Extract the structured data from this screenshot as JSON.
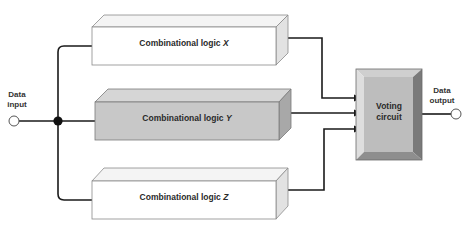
{
  "diagram": {
    "input": {
      "line1": "Data",
      "line2": "input"
    },
    "output": {
      "line1": "Data",
      "line2": "output"
    },
    "modules": [
      {
        "name_prefix": "Combinational logic ",
        "variable": "X",
        "shade": "light"
      },
      {
        "name_prefix": "Combinational logic ",
        "variable": "Y",
        "shade": "dark"
      },
      {
        "name_prefix": "Combinational logic ",
        "variable": "Z",
        "shade": "light"
      }
    ],
    "voter": {
      "line1": "Voting",
      "line2": "circuit"
    },
    "colors": {
      "line": "#1a1a1a",
      "light_front": "#ffffff",
      "light_top": "#f4f4f4",
      "light_side": "#e2e2e2",
      "dark_front": "#c8c8c8",
      "dark_top": "#d6d6d6",
      "dark_side": "#a8a8a8",
      "voter_face": "#bdbdbd",
      "voter_left": "#dedede",
      "voter_top": "#cfcfcf",
      "voter_right": "#7a7a7a",
      "voter_bottom": "#8e8e8e"
    }
  }
}
